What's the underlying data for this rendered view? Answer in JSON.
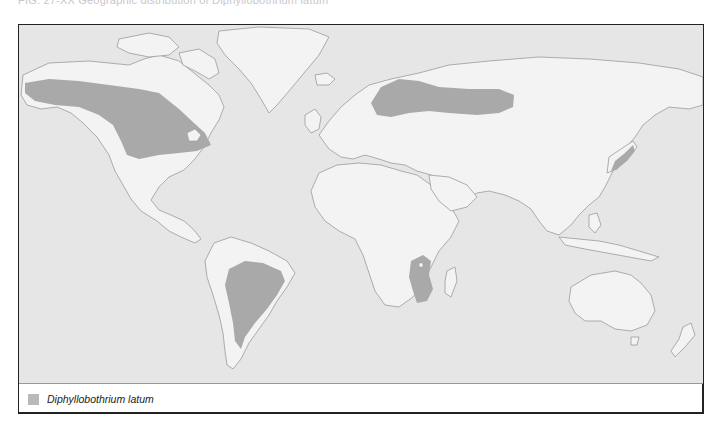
{
  "header": {
    "caption": "FIG. 27-XX  Geographic distribution of Diphyllobothrium latum"
  },
  "map": {
    "type": "world distribution map",
    "colors": {
      "ocean": "#e6e6e6",
      "land": "#f3f3f3",
      "coastline": "#9a9a9a",
      "distribution": "#a9a9a9"
    },
    "shaded_regions": [
      {
        "id": "north-america",
        "label": "Alaska, western & central Canada, Great Lakes"
      },
      {
        "id": "scandinavia-russia",
        "label": "Scandinavia, Baltic, western & central Russia"
      },
      {
        "id": "south-america",
        "label": "Brazil and central South America"
      },
      {
        "id": "east-africa",
        "label": "East / south-central Africa (Great Lakes region)"
      },
      {
        "id": "japan",
        "label": "Japan"
      }
    ]
  },
  "legend": {
    "items": [
      {
        "label": "Diphyllobothrium latum",
        "color": "#b9b9b9"
      }
    ]
  }
}
